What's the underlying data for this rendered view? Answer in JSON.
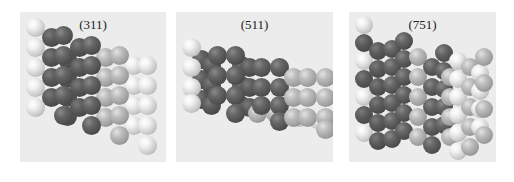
{
  "figure": {
    "panels": [
      {
        "id": "311",
        "title": "(311)",
        "box": {
          "x": 20,
          "y": 12,
          "w": 146,
          "h": 150
        },
        "atom_diameter": 19,
        "atoms": [
          {
            "x": 38,
            "y": 38,
            "c": "darkb"
          },
          {
            "x": 38,
            "y": 57,
            "c": "darkb"
          },
          {
            "x": 38,
            "y": 76,
            "c": "darkb"
          },
          {
            "x": 38,
            "y": 95,
            "c": "darkb"
          },
          {
            "x": 6,
            "y": 6,
            "c": "light"
          },
          {
            "x": 6,
            "y": 26,
            "c": "light"
          },
          {
            "x": 6,
            "y": 46,
            "c": "light"
          },
          {
            "x": 6,
            "y": 66,
            "c": "light"
          },
          {
            "x": 6,
            "y": 86,
            "c": "light"
          },
          {
            "x": 22,
            "y": 16,
            "c": "darkb"
          },
          {
            "x": 22,
            "y": 36,
            "c": "darkb"
          },
          {
            "x": 22,
            "y": 56,
            "c": "darkb"
          },
          {
            "x": 22,
            "y": 76,
            "c": "darkb"
          },
          {
            "x": 50,
            "y": 26,
            "c": "darkb"
          },
          {
            "x": 50,
            "y": 46,
            "c": "darkb"
          },
          {
            "x": 50,
            "y": 66,
            "c": "darkb"
          },
          {
            "x": 50,
            "y": 86,
            "c": "darkb"
          },
          {
            "x": 34,
            "y": 14,
            "c": "dark"
          },
          {
            "x": 34,
            "y": 34,
            "c": "dark"
          },
          {
            "x": 34,
            "y": 54,
            "c": "dark"
          },
          {
            "x": 34,
            "y": 74,
            "c": "dark"
          },
          {
            "x": 34,
            "y": 94,
            "c": "dark"
          },
          {
            "x": 76,
            "y": 36,
            "c": "mid"
          },
          {
            "x": 76,
            "y": 56,
            "c": "mid"
          },
          {
            "x": 76,
            "y": 76,
            "c": "mid"
          },
          {
            "x": 76,
            "y": 96,
            "c": "mid"
          },
          {
            "x": 62,
            "y": 24,
            "c": "dark"
          },
          {
            "x": 62,
            "y": 44,
            "c": "dark"
          },
          {
            "x": 62,
            "y": 64,
            "c": "dark"
          },
          {
            "x": 62,
            "y": 84,
            "c": "dark"
          },
          {
            "x": 62,
            "y": 104,
            "c": "dark"
          },
          {
            "x": 104,
            "y": 44,
            "c": "light"
          },
          {
            "x": 104,
            "y": 64,
            "c": "light"
          },
          {
            "x": 104,
            "y": 84,
            "c": "light"
          },
          {
            "x": 104,
            "y": 104,
            "c": "light"
          },
          {
            "x": 90,
            "y": 34,
            "c": "mid"
          },
          {
            "x": 90,
            "y": 54,
            "c": "mid"
          },
          {
            "x": 90,
            "y": 74,
            "c": "mid"
          },
          {
            "x": 90,
            "y": 94,
            "c": "mid"
          },
          {
            "x": 90,
            "y": 114,
            "c": "mid"
          },
          {
            "x": 118,
            "y": 44,
            "c": "light"
          },
          {
            "x": 118,
            "y": 64,
            "c": "light"
          },
          {
            "x": 118,
            "y": 84,
            "c": "light"
          },
          {
            "x": 118,
            "y": 104,
            "c": "light"
          },
          {
            "x": 118,
            "y": 124,
            "c": "light"
          }
        ]
      },
      {
        "id": "511",
        "title": "(511)",
        "box": {
          "x": 176,
          "y": 12,
          "w": 157,
          "h": 150
        },
        "atom_diameter": 19,
        "atoms": [
          {
            "x": 16,
            "y": 38,
            "c": "darkb"
          },
          {
            "x": 16,
            "y": 58,
            "c": "darkb"
          },
          {
            "x": 16,
            "y": 78,
            "c": "darkb"
          },
          {
            "x": 6,
            "y": 26,
            "c": "light"
          },
          {
            "x": 6,
            "y": 46,
            "c": "light"
          },
          {
            "x": 6,
            "y": 66,
            "c": "light"
          },
          {
            "x": 6,
            "y": 82,
            "c": "light"
          },
          {
            "x": 26,
            "y": 44,
            "c": "darkb"
          },
          {
            "x": 26,
            "y": 64,
            "c": "darkb"
          },
          {
            "x": 26,
            "y": 84,
            "c": "darkb"
          },
          {
            "x": 56,
            "y": 44,
            "c": "darkb"
          },
          {
            "x": 56,
            "y": 64,
            "c": "darkb"
          },
          {
            "x": 56,
            "y": 84,
            "c": "darkb"
          },
          {
            "x": 64,
            "y": 46,
            "c": "darkb"
          },
          {
            "x": 64,
            "y": 66,
            "c": "darkb"
          },
          {
            "x": 64,
            "y": 86,
            "c": "darkb"
          },
          {
            "x": 32,
            "y": 34,
            "c": "dark"
          },
          {
            "x": 32,
            "y": 54,
            "c": "dark"
          },
          {
            "x": 32,
            "y": 74,
            "c": "dark"
          },
          {
            "x": 50,
            "y": 34,
            "c": "dark"
          },
          {
            "x": 50,
            "y": 54,
            "c": "dark"
          },
          {
            "x": 50,
            "y": 74,
            "c": "dark"
          },
          {
            "x": 50,
            "y": 92,
            "c": "dark"
          },
          {
            "x": 72,
            "y": 92,
            "c": "mid"
          },
          {
            "x": 90,
            "y": 92,
            "c": "mid"
          },
          {
            "x": 114,
            "y": 96,
            "c": "light"
          },
          {
            "x": 132,
            "y": 98,
            "c": "light"
          },
          {
            "x": 76,
            "y": 46,
            "c": "dark"
          },
          {
            "x": 76,
            "y": 66,
            "c": "dark"
          },
          {
            "x": 76,
            "y": 84,
            "c": "dark"
          },
          {
            "x": 94,
            "y": 46,
            "c": "dark"
          },
          {
            "x": 94,
            "y": 66,
            "c": "dark"
          },
          {
            "x": 94,
            "y": 84,
            "c": "dark"
          },
          {
            "x": 94,
            "y": 100,
            "c": "dark"
          },
          {
            "x": 108,
            "y": 56,
            "c": "mid"
          },
          {
            "x": 108,
            "y": 76,
            "c": "mid"
          },
          {
            "x": 108,
            "y": 96,
            "c": "mid"
          },
          {
            "x": 122,
            "y": 56,
            "c": "mid"
          },
          {
            "x": 122,
            "y": 76,
            "c": "mid"
          },
          {
            "x": 122,
            "y": 96,
            "c": "mid"
          },
          {
            "x": 140,
            "y": 56,
            "c": "mid"
          },
          {
            "x": 140,
            "y": 76,
            "c": "mid"
          },
          {
            "x": 140,
            "y": 96,
            "c": "mid"
          },
          {
            "x": 140,
            "y": 108,
            "c": "mid"
          }
        ]
      },
      {
        "id": "751",
        "title": "(751)",
        "box": {
          "x": 349,
          "y": 12,
          "w": 147,
          "h": 150
        },
        "atom_diameter": 18,
        "atoms": [
          {
            "x": 6,
            "y": 4,
            "c": "light"
          },
          {
            "x": 6,
            "y": 22,
            "c": "darkb"
          },
          {
            "x": 6,
            "y": 40,
            "c": "light"
          },
          {
            "x": 6,
            "y": 58,
            "c": "darkb"
          },
          {
            "x": 6,
            "y": 76,
            "c": "light"
          },
          {
            "x": 6,
            "y": 94,
            "c": "darkb"
          },
          {
            "x": 6,
            "y": 112,
            "c": "light"
          },
          {
            "x": 20,
            "y": 30,
            "c": "darkb"
          },
          {
            "x": 20,
            "y": 48,
            "c": "darkb"
          },
          {
            "x": 20,
            "y": 66,
            "c": "darkb"
          },
          {
            "x": 20,
            "y": 84,
            "c": "darkb"
          },
          {
            "x": 20,
            "y": 102,
            "c": "darkb"
          },
          {
            "x": 20,
            "y": 120,
            "c": "darkb"
          },
          {
            "x": 34,
            "y": 28,
            "c": "dark"
          },
          {
            "x": 34,
            "y": 46,
            "c": "dark"
          },
          {
            "x": 34,
            "y": 64,
            "c": "dark"
          },
          {
            "x": 34,
            "y": 82,
            "c": "dark"
          },
          {
            "x": 34,
            "y": 100,
            "c": "dark"
          },
          {
            "x": 34,
            "y": 118,
            "c": "dark"
          },
          {
            "x": 46,
            "y": 20,
            "c": "dark"
          },
          {
            "x": 46,
            "y": 38,
            "c": "dark"
          },
          {
            "x": 46,
            "y": 56,
            "c": "dark"
          },
          {
            "x": 46,
            "y": 74,
            "c": "dark"
          },
          {
            "x": 46,
            "y": 92,
            "c": "dark"
          },
          {
            "x": 46,
            "y": 110,
            "c": "dark"
          },
          {
            "x": 60,
            "y": 36,
            "c": "mid"
          },
          {
            "x": 60,
            "y": 56,
            "c": "mid"
          },
          {
            "x": 60,
            "y": 76,
            "c": "mid"
          },
          {
            "x": 60,
            "y": 96,
            "c": "mid"
          },
          {
            "x": 60,
            "y": 116,
            "c": "mid"
          },
          {
            "x": 74,
            "y": 46,
            "c": "dark"
          },
          {
            "x": 74,
            "y": 66,
            "c": "dark"
          },
          {
            "x": 74,
            "y": 86,
            "c": "dark"
          },
          {
            "x": 74,
            "y": 106,
            "c": "dark"
          },
          {
            "x": 74,
            "y": 124,
            "c": "dark"
          },
          {
            "x": 86,
            "y": 32,
            "c": "dark"
          },
          {
            "x": 86,
            "y": 50,
            "c": "dark"
          },
          {
            "x": 86,
            "y": 68,
            "c": "dark"
          },
          {
            "x": 86,
            "y": 86,
            "c": "dark"
          },
          {
            "x": 86,
            "y": 104,
            "c": "dark"
          },
          {
            "x": 92,
            "y": 56,
            "c": "mid"
          },
          {
            "x": 92,
            "y": 76,
            "c": "mid"
          },
          {
            "x": 92,
            "y": 96,
            "c": "mid"
          },
          {
            "x": 92,
            "y": 116,
            "c": "mid"
          },
          {
            "x": 100,
            "y": 40,
            "c": "light"
          },
          {
            "x": 100,
            "y": 58,
            "c": "light"
          },
          {
            "x": 100,
            "y": 76,
            "c": "light"
          },
          {
            "x": 100,
            "y": 94,
            "c": "light"
          },
          {
            "x": 100,
            "y": 112,
            "c": "light"
          },
          {
            "x": 100,
            "y": 130,
            "c": "light"
          },
          {
            "x": 112,
            "y": 46,
            "c": "mid"
          },
          {
            "x": 112,
            "y": 66,
            "c": "mid"
          },
          {
            "x": 112,
            "y": 86,
            "c": "mid"
          },
          {
            "x": 112,
            "y": 106,
            "c": "mid"
          },
          {
            "x": 112,
            "y": 126,
            "c": "mid"
          },
          {
            "x": 122,
            "y": 52,
            "c": "light"
          },
          {
            "x": 122,
            "y": 70,
            "c": "light"
          },
          {
            "x": 122,
            "y": 88,
            "c": "light"
          },
          {
            "x": 122,
            "y": 106,
            "c": "light"
          },
          {
            "x": 126,
            "y": 36,
            "c": "mid"
          },
          {
            "x": 126,
            "y": 62,
            "c": "mid"
          },
          {
            "x": 126,
            "y": 88,
            "c": "mid"
          },
          {
            "x": 126,
            "y": 114,
            "c": "mid"
          }
        ]
      }
    ]
  }
}
